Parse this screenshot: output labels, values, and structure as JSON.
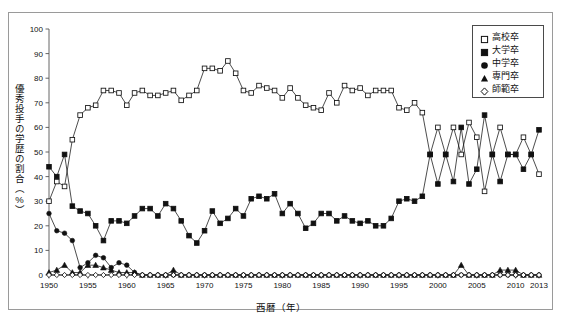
{
  "chart_data": {
    "type": "line",
    "title": "",
    "xlabel": "西暦（年）",
    "ylabel": "優秀投手の学歴の割合（%）",
    "xlim": [
      1950,
      2013
    ],
    "ylim": [
      0,
      100
    ],
    "ytick_step": 10,
    "xtick_step": 5,
    "grid": false,
    "legend_position": "top-right",
    "yticks": [
      "0",
      "10",
      "20",
      "30",
      "40",
      "50",
      "60",
      "70",
      "80",
      "90",
      "100"
    ],
    "xticks": [
      "1950",
      "1955",
      "1960",
      "1965",
      "1970",
      "1975",
      "1980",
      "1985",
      "1990",
      "1995",
      "2000",
      "2005",
      "2010",
      "2013"
    ],
    "x": [
      1950,
      1951,
      1952,
      1953,
      1954,
      1955,
      1956,
      1957,
      1958,
      1959,
      1960,
      1961,
      1962,
      1963,
      1964,
      1965,
      1966,
      1967,
      1968,
      1969,
      1970,
      1971,
      1972,
      1973,
      1974,
      1975,
      1976,
      1977,
      1978,
      1979,
      1980,
      1981,
      1982,
      1983,
      1984,
      1985,
      1986,
      1987,
      1988,
      1989,
      1990,
      1991,
      1992,
      1993,
      1994,
      1995,
      1996,
      1997,
      1998,
      1999,
      2000,
      2001,
      2002,
      2003,
      2004,
      2005,
      2006,
      2007,
      2008,
      2009,
      2010,
      2011,
      2012,
      2013
    ],
    "series": [
      {
        "name": "高校卒",
        "marker": "open-square",
        "color": "#111111",
        "fill": "#ffffff",
        "values": [
          30,
          38,
          36,
          55,
          65,
          68,
          69,
          75,
          75,
          74,
          69,
          74,
          75,
          73,
          73,
          74,
          75,
          71,
          73,
          75,
          84,
          84,
          83,
          87,
          82,
          75,
          74,
          77,
          76,
          75,
          72,
          76,
          72,
          69,
          68,
          67,
          74,
          70,
          77,
          75,
          76,
          73,
          75,
          75,
          75,
          68,
          67,
          70,
          66,
          49,
          60,
          49,
          60,
          49,
          62,
          56,
          34,
          49,
          60,
          49,
          49,
          56,
          49,
          41
        ]
      },
      {
        "name": "大学卒",
        "marker": "filled-square",
        "color": "#111111",
        "fill": "#111111",
        "values": [
          44,
          40,
          49,
          28,
          26,
          25,
          20,
          14,
          22,
          22,
          21,
          24,
          27,
          27,
          24,
          29,
          27,
          22,
          16,
          13,
          18,
          26,
          21,
          23,
          27,
          24,
          31,
          32,
          31,
          33,
          25,
          29,
          25,
          19,
          21,
          25,
          25,
          22,
          24,
          22,
          21,
          22,
          20,
          20,
          23,
          30,
          31,
          30,
          32,
          49,
          37,
          49,
          38,
          60,
          37,
          43,
          65,
          49,
          38,
          49,
          49,
          43,
          49,
          59
        ]
      },
      {
        "name": "中学卒",
        "marker": "filled-circle",
        "color": "#111111",
        "fill": "#111111",
        "values": [
          25,
          18,
          17,
          14,
          3,
          5,
          8,
          7,
          3,
          5,
          4,
          1,
          0,
          0,
          0,
          0,
          0,
          0,
          0,
          0,
          0,
          0,
          0,
          0,
          0,
          0,
          0,
          0,
          0,
          0,
          0,
          0,
          0,
          0,
          0,
          0,
          0,
          0,
          0,
          0,
          0,
          0,
          0,
          0,
          0,
          0,
          0,
          0,
          0,
          0,
          0,
          0,
          0,
          0,
          0,
          0,
          0,
          0,
          0,
          0,
          0,
          0,
          0,
          0
        ]
      },
      {
        "name": "専門卒",
        "marker": "filled-triangle",
        "color": "#111111",
        "fill": "#111111",
        "values": [
          1,
          2,
          4,
          1,
          1,
          4,
          4,
          3,
          2,
          1,
          1,
          1,
          0,
          0,
          0,
          0,
          2,
          0,
          0,
          0,
          0,
          0,
          0,
          0,
          0,
          0,
          0,
          0,
          0,
          0,
          0,
          0,
          0,
          0,
          0,
          0,
          0,
          0,
          0,
          0,
          0,
          0,
          0,
          0,
          0,
          0,
          0,
          0,
          0,
          0,
          0,
          0,
          0,
          4,
          0,
          0,
          0,
          0,
          2,
          2,
          2,
          0,
          0,
          0
        ]
      },
      {
        "name": "師範卒",
        "marker": "open-diamond",
        "color": "#111111",
        "fill": "#ffffff",
        "values": [
          0,
          0,
          0,
          0,
          0,
          0,
          0,
          0,
          0,
          0,
          0,
          0,
          0,
          0,
          0,
          0,
          0,
          0,
          0,
          0,
          0,
          0,
          0,
          0,
          0,
          0,
          0,
          0,
          0,
          0,
          0,
          0,
          0,
          0,
          0,
          0,
          0,
          0,
          0,
          0,
          0,
          0,
          0,
          0,
          0,
          0,
          0,
          0,
          0,
          0,
          0,
          0,
          0,
          0,
          0,
          0,
          0,
          0,
          0,
          0,
          0,
          0,
          0,
          0
        ]
      }
    ]
  },
  "legend": {
    "items": [
      {
        "label": "高校卒",
        "marker": "open-square"
      },
      {
        "label": "大学卒",
        "marker": "filled-square"
      },
      {
        "label": "中学卒",
        "marker": "filled-circle"
      },
      {
        "label": "専門卒",
        "marker": "filled-triangle"
      },
      {
        "label": "師範卒",
        "marker": "open-diamond"
      }
    ]
  },
  "axes": {
    "y_title": "優秀投手の学歴の割合（%）",
    "x_title": "西暦（年）"
  },
  "colors": {
    "frame": "#9a9a9a",
    "axis": "#555555",
    "ink": "#111111",
    "background": "#ffffff"
  }
}
